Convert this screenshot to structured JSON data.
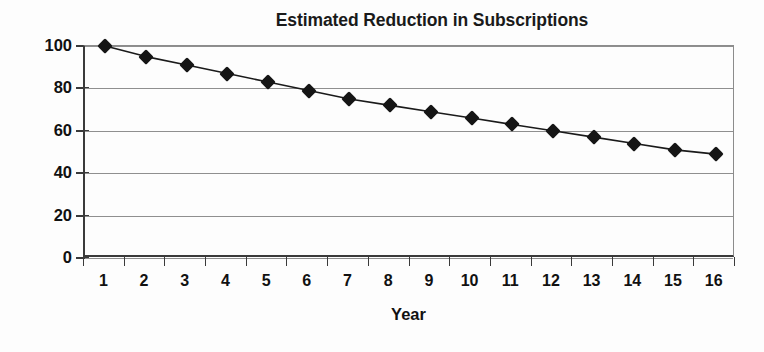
{
  "chart_data": {
    "type": "line",
    "title": "Estimated Reduction in Subscriptions",
    "xlabel": "Year",
    "ylabel": "",
    "categories": [
      "1",
      "2",
      "3",
      "4",
      "5",
      "6",
      "7",
      "8",
      "9",
      "10",
      "11",
      "12",
      "13",
      "14",
      "15",
      "16"
    ],
    "values": [
      100,
      95,
      91,
      87,
      83,
      79,
      75,
      72,
      69,
      66,
      63,
      60,
      57,
      54,
      51,
      49
    ],
    "series": [
      {
        "name": "Estimated Subscriptions",
        "values": [
          100,
          95,
          91,
          87,
          83,
          79,
          75,
          72,
          69,
          66,
          63,
          60,
          57,
          54,
          51,
          49
        ]
      }
    ],
    "ylim": [
      0,
      100
    ],
    "y_ticks": [
      0,
      20,
      40,
      60,
      80,
      100
    ],
    "ytick_labels": [
      "0",
      "20",
      "40",
      "60",
      "80",
      "100"
    ],
    "grid": true,
    "grid_axis": "y",
    "legend": false,
    "legend_position": "none",
    "marker": "diamond",
    "marker_color": "#151515",
    "line_color": "#1a1a1a",
    "background_color": "#fdfdfd",
    "axis_color": "#3a3a3a",
    "gridline_color": "#8f8f8f"
  }
}
